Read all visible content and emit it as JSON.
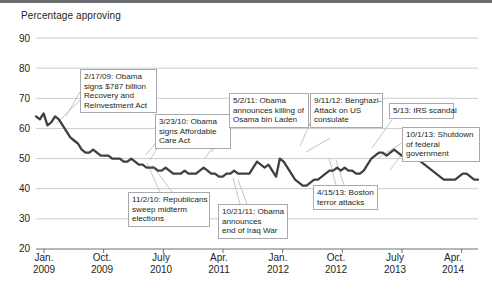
{
  "chart_data": {
    "type": "line",
    "title": "",
    "ylabel": "Percentage approving",
    "xlabel": "",
    "ylim": [
      20,
      90
    ],
    "yticks": [
      20,
      30,
      40,
      50,
      60,
      70,
      80,
      90
    ],
    "grid": true,
    "legend": "none",
    "xtick_labels": [
      {
        "month": "Jan.",
        "year": "2009"
      },
      {
        "month": "Oct.",
        "year": "2009"
      },
      {
        "month": "July",
        "year": "2010"
      },
      {
        "month": "Apr.",
        "year": "2011"
      },
      {
        "month": "Jan.",
        "year": "2012"
      },
      {
        "month": "Oct.",
        "year": "2012"
      },
      {
        "month": "July",
        "year": "2013"
      },
      {
        "month": "Apr.",
        "year": "2014"
      }
    ],
    "series": [
      {
        "name": "Presidential approval",
        "color": "#404040",
        "values": [
          64,
          63,
          65,
          61,
          62,
          64,
          63,
          61,
          59,
          57,
          56,
          55,
          53,
          52,
          52,
          53,
          52,
          51,
          51,
          51,
          50,
          50,
          50,
          49,
          49,
          50,
          49,
          48,
          48,
          47,
          47,
          47,
          46,
          46,
          47,
          46,
          45,
          45,
          45,
          46,
          45,
          45,
          45,
          46,
          47,
          46,
          45,
          45,
          44,
          44,
          45,
          45,
          46,
          45,
          45,
          45,
          45,
          47,
          49,
          48,
          47,
          48,
          46,
          44,
          50,
          49,
          47,
          45,
          43,
          42,
          41,
          41,
          42,
          43,
          43,
          44,
          45,
          46,
          46,
          47,
          46,
          47,
          46,
          46,
          45,
          45,
          46,
          48,
          50,
          51,
          52,
          52,
          51,
          52,
          53,
          52,
          51,
          51,
          52,
          51,
          50,
          49,
          48,
          47,
          46,
          45,
          44,
          43,
          43,
          43,
          43,
          44,
          45,
          45,
          44,
          43,
          43
        ]
      }
    ],
    "annotations": [
      {
        "id": "recovery-act",
        "date": "2/17/09",
        "lines": [
          "2/17/09: Obama",
          "signs $787 billion",
          "Recovery and",
          "Reinvestment Act"
        ]
      },
      {
        "id": "affordable-care-act",
        "date": "3/23/10",
        "lines": [
          "3/23/10: Obama",
          "signs Affordable",
          "Care Act"
        ]
      },
      {
        "id": "bin-laden",
        "date": "5/2/11",
        "lines": [
          "5/2/11: Obama",
          "announces killing of",
          "Osama bin Laden"
        ]
      },
      {
        "id": "benghazi",
        "date": "9/11/12",
        "lines": [
          "9/11/12: Benghazi-",
          "Attack on US",
          "consulate"
        ]
      },
      {
        "id": "irs-scandal",
        "date": "5/13",
        "lines": [
          "5/13: IRS scandal"
        ]
      },
      {
        "id": "government-shutdown",
        "date": "10/1/13",
        "lines": [
          "10/1/13: Shutdown",
          "of federal",
          "government"
        ]
      },
      {
        "id": "midterm-elections",
        "date": "11/2/10",
        "lines": [
          "11/2/10: Republicans",
          "sweep midterm",
          "elections"
        ]
      },
      {
        "id": "iraq-war-end",
        "date": "10/21/11",
        "lines": [
          "10/21/11: Obama",
          "announces",
          "end of Iraq War"
        ]
      },
      {
        "id": "boston-attacks",
        "date": "4/15/13",
        "lines": [
          "4/15/13: Boston",
          "terror attacks"
        ]
      }
    ]
  },
  "axis": {
    "y_labels": [
      "90",
      "80",
      "70",
      "60",
      "50",
      "40",
      "30",
      "20"
    ],
    "title": "Percentage approving"
  },
  "colors": {
    "line": "#404040",
    "grid": "#c9cacc",
    "axis": "#6d6e71",
    "callout_border": "#a7a9ac",
    "text": "#231f20"
  }
}
